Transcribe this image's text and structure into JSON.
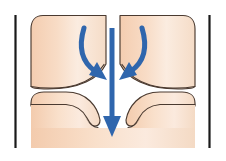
{
  "figure": {
    "caption": "",
    "width": 226,
    "height": 161,
    "background_color": "#ffffff"
  },
  "colors": {
    "tissue_fill": "#f7d8c0",
    "tissue_fill_light": "#fbe9dc",
    "tissue_outline": "#4a3a30",
    "lumen_fill": "#fdfbf7",
    "boundary_line": "#1a1a1a",
    "arrow_blue": "#2f66ad",
    "arrow_blue_dark": "#24528c"
  },
  "anatomy": {
    "left_boundary_line": {
      "label": "left boundary line",
      "x": 15.5,
      "y_top": 15,
      "y_bottom": 148,
      "stroke_width": 2.2
    },
    "right_boundary_line": {
      "label": "right boundary line",
      "x": 209.5,
      "y_top": 15,
      "y_bottom": 148,
      "stroke_width": 2.2
    },
    "tissue_block": {
      "label": "tissue mass",
      "x_left": 31,
      "x_right": 195,
      "y_top": 15,
      "y_bottom": 148,
      "corner_radius": 14
    },
    "upper_funnel": {
      "label": "upper funnel wall",
      "description": "tapering walls converging toward central canal"
    },
    "lower_lips": {
      "label": "lower tissue lips",
      "description": "flared tissue forming notches beside the canal"
    },
    "canal": {
      "label": "central canal",
      "x_center": 112,
      "width_narrow": 13
    }
  },
  "arrows": [
    {
      "name": "left-curved-arrow",
      "label": "left converging flow arrow",
      "type": "curved",
      "start": {
        "x": 84,
        "y": 28
      },
      "control_1": {
        "x": 78,
        "y": 52
      },
      "control_2": {
        "x": 88,
        "y": 66
      },
      "end": {
        "x": 103,
        "y": 78
      },
      "stroke_width": 5.0,
      "head_size": 12,
      "color": "#2f66ad"
    },
    {
      "name": "center-straight-arrow",
      "label": "central downward flow arrow",
      "type": "straight",
      "start": {
        "x": 112,
        "y": 28
      },
      "end": {
        "x": 112,
        "y": 137
      },
      "stroke_width": 5.0,
      "head_size": 17,
      "color": "#2f66ad"
    },
    {
      "name": "right-curved-arrow",
      "label": "right converging flow arrow",
      "type": "curved",
      "start": {
        "x": 142,
        "y": 28
      },
      "control_1": {
        "x": 148,
        "y": 52
      },
      "control_2": {
        "x": 138,
        "y": 66
      },
      "end": {
        "x": 123,
        "y": 78
      },
      "stroke_width": 5.0,
      "head_size": 12,
      "color": "#2f66ad"
    }
  ]
}
